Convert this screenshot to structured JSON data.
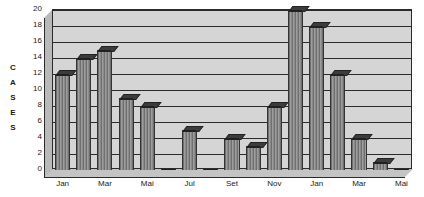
{
  "chart_data": {
    "type": "bar",
    "title": "",
    "xlabel": "",
    "ylabel": "CASES",
    "ylim": [
      0,
      20
    ],
    "ytick_step": 2,
    "yticks": [
      0,
      2,
      4,
      6,
      8,
      10,
      12,
      14,
      16,
      18,
      20
    ],
    "grid": true,
    "legend": "none",
    "categories": [
      "Jan",
      "Fev",
      "Mar",
      "Abr",
      "Mai",
      "Jun",
      "Jul",
      "Ago",
      "Set",
      "Out",
      "Nov",
      "Dez",
      "Jan",
      "Fev",
      "Mar",
      "Abr",
      "Mai",
      "Jun",
      "Jul",
      "Ago",
      "Set",
      "Out",
      "Nov",
      "Dez"
    ],
    "values": [
      12,
      14,
      15,
      9,
      8,
      0,
      5,
      0,
      4,
      3,
      8,
      20,
      18,
      12,
      4,
      1,
      0,
      0,
      0,
      0,
      0,
      0,
      0,
      0
    ],
    "visible_xtick_labels": [
      "Jan",
      "Mar",
      "Mai",
      "Jul",
      "Set",
      "Nov",
      "Jan",
      "Mar",
      "Mai"
    ],
    "visible_xtick_indices": [
      0,
      2,
      4,
      6,
      8,
      10,
      12,
      14,
      16
    ],
    "colors": {
      "bar_fill": "#8a8a8a",
      "bar_hatch": "#6f6f6f",
      "bar_top": "#3c3c3c",
      "plot_background": "#d5d5d5",
      "depth_wall": "#b9b9b9",
      "axis_line": "#2b2b2b",
      "text": "#1a1a1a",
      "page_background": "#ffffff"
    },
    "axis_title_letters": [
      "C",
      "A",
      "S",
      "E",
      "S"
    ]
  }
}
